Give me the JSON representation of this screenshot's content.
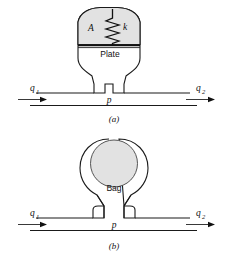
{
  "figure": {
    "background_color": "#ffffff",
    "line_color": "#1a1a1a",
    "shade_color": "#e2e2e2"
  },
  "panel_a": {
    "caption": "(a)",
    "area_label": "A",
    "spring_label": "k",
    "plate_label": "Plate",
    "pressure_label": "p",
    "inflow_label": "q",
    "inflow_subscript": "1",
    "outflow_label": "q",
    "outflow_subscript": "2",
    "chamber_name": "spring-loaded-plate-chamber"
  },
  "panel_b": {
    "caption": "(b)",
    "bag_label": "Bag",
    "pressure_label": "p",
    "inflow_label": "q",
    "inflow_subscript": "1",
    "outflow_label": "q",
    "outflow_subscript": "2",
    "chamber_name": "bag-chamber"
  }
}
